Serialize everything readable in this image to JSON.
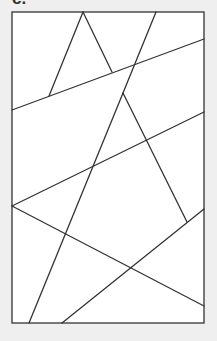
{
  "figure": {
    "label": "c.",
    "background": "#efefef",
    "panel_fill": "#ffffff",
    "stroke_color": "#333333",
    "stroke_width": 1.3,
    "frame": {
      "x": 12,
      "y": 12,
      "width": 192,
      "height": 311
    },
    "segments": [
      {
        "name": "upper-triangle-left-leg",
        "x1": 83,
        "y1": 12,
        "x2": 49,
        "y2": 96
      },
      {
        "name": "upper-triangle-right-leg",
        "x1": 83,
        "y1": 12,
        "x2": 112,
        "y2": 72
      },
      {
        "name": "line-1",
        "x1": 12,
        "y1": 110,
        "x2": 204,
        "y2": 39
      },
      {
        "name": "top-diagonal",
        "x1": 156,
        "y1": 12,
        "x2": 123,
        "y2": 93
      },
      {
        "name": "lower-triangle-left-leg",
        "x1": 123,
        "y1": 93,
        "x2": 29,
        "y2": 323
      },
      {
        "name": "lower-triangle-right-leg",
        "x1": 123,
        "y1": 93,
        "x2": 187,
        "y2": 222
      },
      {
        "name": "line-2",
        "x1": 12,
        "y1": 206,
        "x2": 204,
        "y2": 112
      },
      {
        "name": "line-3",
        "x1": 12,
        "y1": 206,
        "x2": 204,
        "y2": 306
      },
      {
        "name": "line-4",
        "x1": 62,
        "y1": 323,
        "x2": 204,
        "y2": 209
      }
    ]
  }
}
